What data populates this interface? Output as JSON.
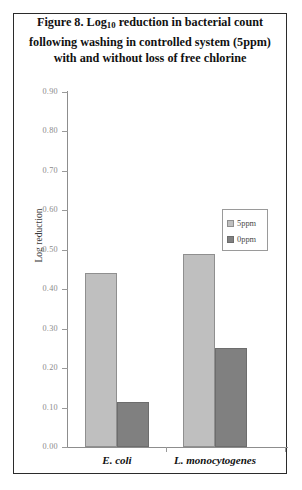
{
  "figure": {
    "title_lines": [
      "Figure 8. Log₁₀ reduction in bacterial count",
      "following washing in controlled system (5ppm)",
      "with and without loss of free chlorine"
    ],
    "title_plain": "Figure 8. Log10 reduction in bacterial count following washing in controlled system (5ppm) with and without loss of free chlorine"
  },
  "chart_data": {
    "type": "bar",
    "title": "Figure 8. Log10 reduction in bacterial count following washing in controlled system (5ppm) with and without loss of free chlorine",
    "xlabel": "",
    "ylabel": "Log reduction",
    "categories": [
      "E. coli",
      "L. monocytogenes"
    ],
    "series": [
      {
        "name": "5ppm",
        "color": "#bfbfbf",
        "values": [
          0.44,
          0.49
        ]
      },
      {
        "name": "0ppm",
        "color": "#808080",
        "values": [
          0.115,
          0.25
        ]
      }
    ],
    "ylim": [
      0.0,
      0.9
    ],
    "ytick_step": 0.1,
    "ytick_labels": [
      "0.90",
      "0.80",
      "0.70",
      "0.60",
      "0.50",
      "0.40",
      "0.30",
      "0.20",
      "0.10",
      "0.00"
    ],
    "grid": false,
    "legend_position": "inside-upper-right"
  }
}
